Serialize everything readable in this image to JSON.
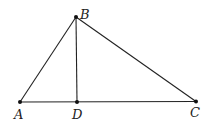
{
  "diagram": {
    "type": "triangle-with-altitude",
    "points": {
      "A": {
        "label": "A",
        "x": 20,
        "y": 102,
        "lx": 14,
        "ly": 119
      },
      "B": {
        "label": "B",
        "x": 76,
        "y": 17,
        "lx": 80,
        "ly": 19
      },
      "C": {
        "label": "C",
        "x": 196,
        "y": 101.5,
        "lx": 190,
        "ly": 117
      },
      "D": {
        "label": "D",
        "x": 77,
        "y": 102,
        "lx": 72,
        "ly": 119
      }
    },
    "segments": [
      [
        "A",
        "B"
      ],
      [
        "B",
        "C"
      ],
      [
        "A",
        "C"
      ],
      [
        "B",
        "D"
      ]
    ],
    "stroke_color": "#222222"
  }
}
